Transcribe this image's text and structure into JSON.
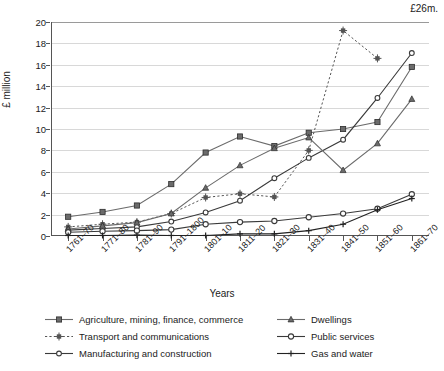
{
  "chart_data": {
    "type": "line",
    "title": "",
    "xlabel": "Years",
    "ylabel": "£ million",
    "ylim": [
      0,
      20
    ],
    "yticks": [
      0,
      2,
      4,
      6,
      8,
      10,
      12,
      14,
      16,
      18,
      20
    ],
    "grid": true,
    "legend_position": "bottom",
    "annotation": "£26m.",
    "categories": [
      "1761–70",
      "1771–80",
      "1781–90",
      "1791–1800",
      "1801–10",
      "1811–20",
      "1821–30",
      "1831–40",
      "1841–50",
      "1851–60",
      "1861–70"
    ],
    "series": [
      {
        "name": "Agriculture, mining, finance, commerce",
        "color": "#6b6b6b",
        "marker": "square",
        "dash": "solid",
        "values": [
          1.8,
          2.25,
          2.85,
          4.85,
          7.8,
          9.3,
          8.4,
          9.65,
          10.0,
          10.65,
          15.8
        ]
      },
      {
        "name": "Transport and communications",
        "color": "#555555",
        "marker": "star",
        "dash": "dotted",
        "values": [
          0.85,
          1.1,
          1.3,
          2.1,
          3.6,
          3.95,
          3.65,
          8.0,
          19.2,
          16.6,
          null
        ]
      },
      {
        "name": "Manufacturing and construction",
        "color": "#3a3a3a",
        "marker": "circle",
        "dash": "solid",
        "values": [
          0.55,
          0.7,
          0.85,
          1.35,
          2.2,
          3.3,
          5.4,
          7.3,
          9.0,
          12.9,
          17.1
        ]
      },
      {
        "name": "Dwellings",
        "color": "#6b6b6b",
        "marker": "triangle",
        "dash": "solid",
        "values": [
          0.65,
          0.95,
          1.25,
          2.1,
          4.5,
          6.6,
          8.2,
          9.2,
          6.15,
          8.65,
          12.8
        ]
      },
      {
        "name": "Public services",
        "color": "#3a3a3a",
        "marker": "open-circle",
        "dash": "solid",
        "values": [
          0.35,
          0.45,
          0.5,
          0.6,
          1.1,
          1.3,
          1.4,
          1.75,
          2.1,
          2.55,
          3.9
        ]
      },
      {
        "name": "Gas and water",
        "color": "#222222",
        "marker": "plus",
        "dash": "solid",
        "values": [
          0.05,
          0.05,
          0.08,
          0.05,
          0.05,
          0.2,
          0.2,
          0.5,
          1.1,
          2.45,
          3.5
        ]
      }
    ]
  },
  "legend": {
    "entries": [
      {
        "label": "Agriculture, mining, finance, commerce",
        "series_index": 0
      },
      {
        "label": "Dwellings",
        "series_index": 3
      },
      {
        "label": "Transport and communications",
        "series_index": 1
      },
      {
        "label": "Public services",
        "series_index": 4
      },
      {
        "label": "Manufacturing and construction",
        "series_index": 2
      },
      {
        "label": "Gas and water",
        "series_index": 5
      }
    ]
  }
}
